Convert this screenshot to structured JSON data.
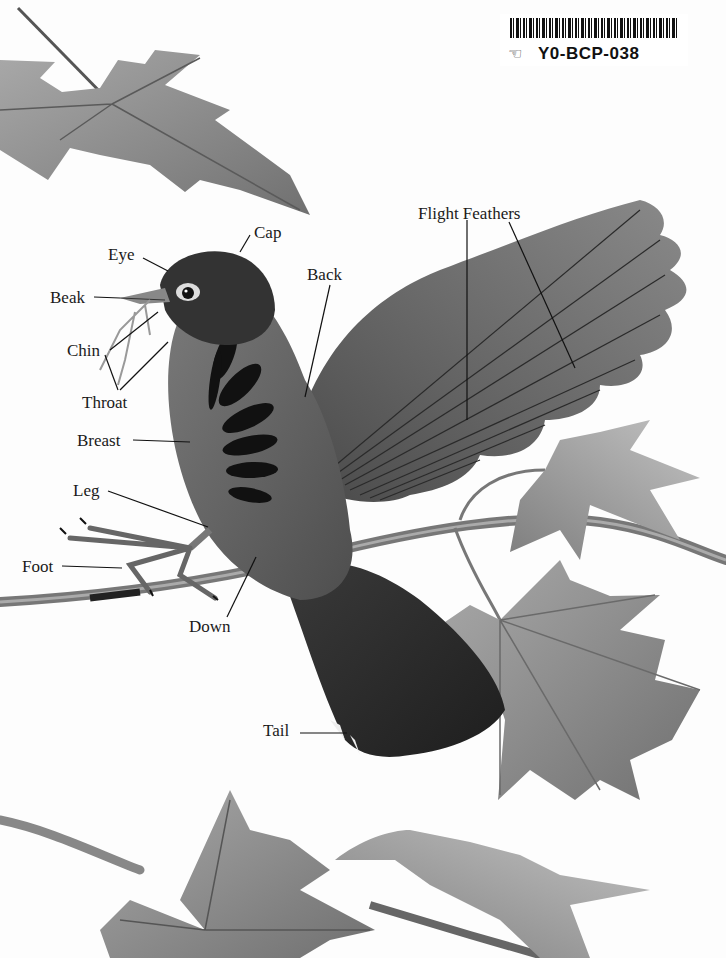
{
  "catalog_sticker": {
    "code": "Y0-BCP-038",
    "icon": "hand-icon"
  },
  "diagram": {
    "labels": {
      "cap": "Cap",
      "eye": "Eye",
      "beak": "Beak",
      "chin": "Chin",
      "throat": "Throat",
      "breast": "Breast",
      "leg": "Leg",
      "foot": "Foot",
      "down": "Down",
      "back": "Back",
      "flight_feathers": "Flight Feathers",
      "tail": "Tail"
    }
  },
  "colors": {
    "background": "#fdfdfd",
    "ink": "#1a1a1a",
    "bird_dark": "#2b2b2b",
    "bird_mid": "#6a6a6a",
    "leaf": "#8a8a8a",
    "leaf_light": "#b4b4b4",
    "branch": "#7a7a7a"
  }
}
